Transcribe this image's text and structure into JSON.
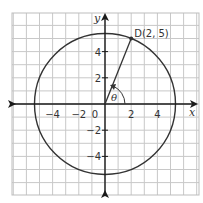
{
  "diagram": {
    "type": "coordinate-plane-circle",
    "axes": {
      "x_label": "x",
      "y_label": "y",
      "x_ticks": [
        {
          "value": -4,
          "label": "−4"
        },
        {
          "value": -2,
          "label": "−2"
        },
        {
          "value": 0,
          "label": "0"
        },
        {
          "value": 2,
          "label": "2"
        },
        {
          "value": 4,
          "label": "4"
        }
      ],
      "y_ticks": [
        {
          "value": 4,
          "label": "4"
        },
        {
          "value": 2,
          "label": "2"
        },
        {
          "value": -2,
          "label": "−2"
        },
        {
          "value": -4,
          "label": "−4"
        }
      ]
    },
    "circle": {
      "center": [
        0,
        0
      ],
      "radius_squared": 29
    },
    "point": {
      "name": "D",
      "x": 2,
      "y": 5,
      "label": "D(2, 5)"
    },
    "angle": {
      "label": "θ"
    },
    "colors": {
      "grid": "#c8c8c8",
      "axes": "#1a1a1a",
      "circle": "#333333",
      "text": "#333333"
    }
  }
}
